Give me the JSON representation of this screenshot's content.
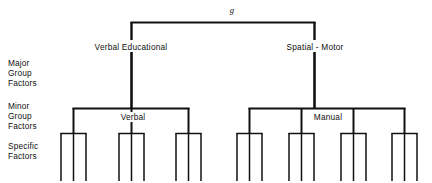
{
  "diagram": {
    "title_symbol": "g",
    "tier_labels": [
      {
        "id": "major",
        "text": "Major\nGroup\nFactors"
      },
      {
        "id": "minor",
        "text": "Minor\nGroup\nFactors"
      },
      {
        "id": "specific",
        "text": "Specific\nFactors"
      }
    ],
    "nodes": {
      "root": "g",
      "major_left": "Verbal Educational",
      "major_right": "Spatial - Motor",
      "minor_left_named": "Verbal",
      "minor_right_named": "Manual"
    },
    "colors": {
      "line": "#101010",
      "text": "#101010",
      "background": "#ffffff"
    },
    "structure": {
      "major_branches": 2,
      "minor_branches_left": 3,
      "minor_branches_right": 4,
      "specific_per_minor": 3
    }
  }
}
